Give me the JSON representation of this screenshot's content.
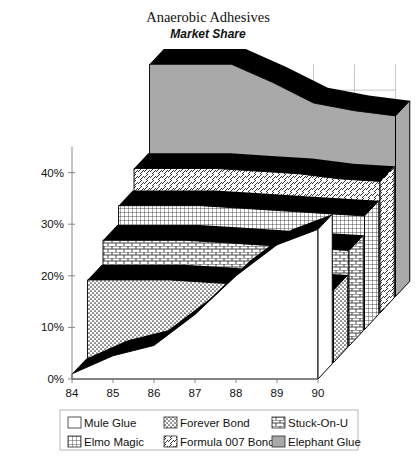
{
  "chart_data": {
    "type": "area",
    "title": "Anaerobic Adhesives",
    "subtitle": "Market Share",
    "xlabel": "",
    "ylabel": "",
    "categories": [
      "84",
      "85",
      "86",
      "87",
      "88",
      "89",
      "90"
    ],
    "x": [
      84,
      85,
      86,
      87,
      88,
      89,
      90
    ],
    "ylim": [
      0,
      45
    ],
    "ytick_values": [
      0,
      10,
      20,
      30,
      40
    ],
    "ytick_labels": [
      "0%",
      "10%",
      "20%",
      "30%",
      "40%"
    ],
    "grid": true,
    "legend_position": "bottom",
    "projection": "3d-ribbon",
    "series": [
      {
        "name": "Mule Glue",
        "pattern": "solid-white",
        "color": "#ffffff",
        "depth_index": 0,
        "values": [
          1.0,
          4.5,
          6.5,
          12.5,
          20.0,
          26.0,
          29.0
        ]
      },
      {
        "name": "Forever Bond",
        "pattern": "dotted",
        "color": "#ffffff",
        "depth_index": 1,
        "values": [
          16.0,
          16.0,
          16.0,
          15.5,
          15.0,
          14.5,
          14.0
        ]
      },
      {
        "name": "Stuck-On-U",
        "pattern": "brick",
        "color": "#ffffff",
        "depth_index": 2,
        "values": [
          20.5,
          20.5,
          20.5,
          20.0,
          19.5,
          19.0,
          18.5
        ]
      },
      {
        "name": "Elmo Magic",
        "pattern": "grid",
        "color": "#ffffff",
        "depth_index": 3,
        "values": [
          24.0,
          24.0,
          24.0,
          23.5,
          23.0,
          22.5,
          22.0
        ]
      },
      {
        "name": "Formula 007 Bond",
        "pattern": "diagonal",
        "color": "#ffffff",
        "depth_index": 4,
        "values": [
          28.0,
          28.0,
          28.0,
          27.5,
          27.0,
          26.0,
          25.5
        ]
      },
      {
        "name": "Elephant Glue",
        "pattern": "solid-gray",
        "color": "#a9a9a9",
        "depth_index": 5,
        "values": [
          45.0,
          45.0,
          45.0,
          41.5,
          37.5,
          36.0,
          35.0
        ]
      }
    ]
  },
  "legend": {
    "items": [
      {
        "label": "Mule Glue",
        "pattern": "solid-white"
      },
      {
        "label": "Forever Bond",
        "pattern": "dotted"
      },
      {
        "label": "Stuck-On-U",
        "pattern": "brick"
      },
      {
        "label": "Elmo Magic",
        "pattern": "grid"
      },
      {
        "label": "Formula 007 Bond",
        "pattern": "diagonal"
      },
      {
        "label": "Elephant Glue",
        "pattern": "solid-gray"
      }
    ]
  },
  "colors": {
    "elephant_gray": "#a9a9a9",
    "edge_black": "#000000",
    "gridline": "#b9b9b9",
    "text": "#111111"
  }
}
